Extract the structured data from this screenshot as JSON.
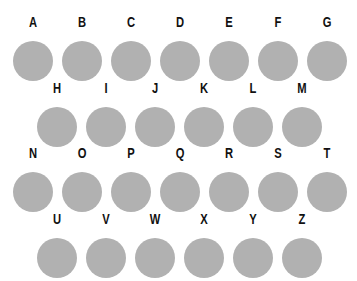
{
  "keyboard": {
    "circle_color": "#b1b1b1",
    "label_color": "#111111",
    "rows": [
      {
        "keys": [
          "A",
          "B",
          "C",
          "D",
          "E",
          "F",
          "G"
        ]
      },
      {
        "keys": [
          "H",
          "I",
          "J",
          "K",
          "L",
          "M"
        ]
      },
      {
        "keys": [
          "N",
          "O",
          "P",
          "Q",
          "R",
          "S",
          "T"
        ]
      },
      {
        "keys": [
          "U",
          "V",
          "W",
          "X",
          "Y",
          "Z"
        ]
      }
    ]
  }
}
